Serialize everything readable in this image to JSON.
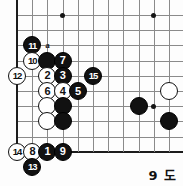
{
  "diagram": {
    "caption": "9 도",
    "type": "go-board-problem-diagram",
    "board": {
      "edges": {
        "left": true,
        "bottom": true,
        "top": false,
        "right": false
      },
      "origin_x": 17,
      "origin_y": 15,
      "spacing": 15.2,
      "cols": 11,
      "rows": 10,
      "star_points": [
        {
          "col": 3,
          "row": 0
        },
        {
          "col": 9,
          "row": 0
        },
        {
          "col": 9,
          "row": 6
        }
      ]
    },
    "markers": [
      {
        "label": "a",
        "col": 2,
        "row": 2
      }
    ],
    "stones": [
      {
        "color": "black",
        "number": "11",
        "col": 1,
        "row": 2
      },
      {
        "color": "white",
        "number": "10",
        "col": 1,
        "row": 3
      },
      {
        "color": "black",
        "number": "",
        "col": 2,
        "row": 3
      },
      {
        "color": "black",
        "number": "7",
        "col": 3,
        "row": 3
      },
      {
        "color": "white",
        "number": "12",
        "col": 0,
        "row": 4
      },
      {
        "color": "white",
        "number": "2",
        "col": 2,
        "row": 4
      },
      {
        "color": "black",
        "number": "3",
        "col": 3,
        "row": 4
      },
      {
        "color": "black",
        "number": "15",
        "col": 5,
        "row": 4
      },
      {
        "color": "white",
        "number": "6",
        "col": 2,
        "row": 5
      },
      {
        "color": "white",
        "number": "4",
        "col": 3,
        "row": 5
      },
      {
        "color": "black",
        "number": "5",
        "col": 4,
        "row": 5
      },
      {
        "color": "white",
        "number": "",
        "col": 2,
        "row": 6
      },
      {
        "color": "black",
        "number": "",
        "col": 3,
        "row": 6
      },
      {
        "color": "black",
        "number": "",
        "col": 8,
        "row": 6
      },
      {
        "color": "white",
        "number": "",
        "col": 10,
        "row": 5
      },
      {
        "color": "black",
        "number": "",
        "col": 10,
        "row": 7
      },
      {
        "color": "white",
        "number": "",
        "col": 2,
        "row": 7
      },
      {
        "color": "black",
        "number": "",
        "col": 3,
        "row": 7
      },
      {
        "color": "white",
        "number": "14",
        "col": 0,
        "row": 9
      },
      {
        "color": "white",
        "number": "8",
        "col": 1,
        "row": 9
      },
      {
        "color": "black",
        "number": "1",
        "col": 2,
        "row": 9
      },
      {
        "color": "black",
        "number": "9",
        "col": 3,
        "row": 9
      },
      {
        "color": "black",
        "number": "13",
        "col": 1,
        "row": 10
      }
    ],
    "colors": {
      "black_stone": "#111111",
      "white_stone": "#ffffff",
      "grid_line": "#8a8a8a",
      "edge_line": "#1c1c1c",
      "background": "#fdfdfd"
    }
  }
}
